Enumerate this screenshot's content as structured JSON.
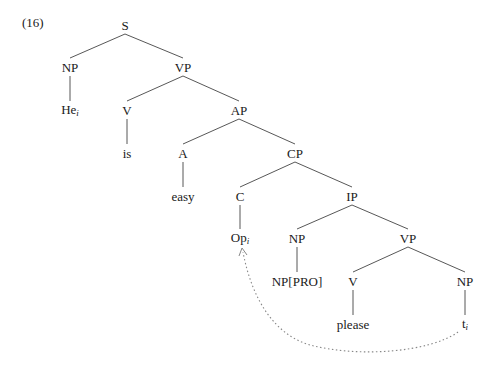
{
  "example_number": "(16)",
  "tree": {
    "nodes": [
      {
        "id": "S",
        "label": "S",
        "x": 125,
        "y": 25
      },
      {
        "id": "NP1",
        "label": "NP",
        "x": 70,
        "y": 67
      },
      {
        "id": "VP1",
        "label": "VP",
        "x": 183,
        "y": 67
      },
      {
        "id": "He",
        "label": "He",
        "sub": "i",
        "x": 70,
        "y": 110
      },
      {
        "id": "V1",
        "label": "V",
        "x": 127,
        "y": 110
      },
      {
        "id": "AP",
        "label": "AP",
        "x": 239,
        "y": 110
      },
      {
        "id": "is",
        "label": "is",
        "x": 127,
        "y": 153
      },
      {
        "id": "A",
        "label": "A",
        "x": 183,
        "y": 153
      },
      {
        "id": "CP",
        "label": "CP",
        "x": 295,
        "y": 153
      },
      {
        "id": "easy",
        "label": "easy",
        "x": 183,
        "y": 196
      },
      {
        "id": "C",
        "label": "C",
        "x": 240,
        "y": 196
      },
      {
        "id": "IP",
        "label": "IP",
        "x": 352,
        "y": 196
      },
      {
        "id": "Op",
        "label": "Op",
        "sub": "i",
        "x": 240,
        "y": 238
      },
      {
        "id": "NP2",
        "label": "NP",
        "x": 297,
        "y": 238
      },
      {
        "id": "VP2",
        "label": "VP",
        "x": 408,
        "y": 238
      },
      {
        "id": "PRO",
        "label": "NP[PRO]",
        "x": 297,
        "y": 281
      },
      {
        "id": "V2",
        "label": "V",
        "x": 353,
        "y": 281
      },
      {
        "id": "NP3",
        "label": "NP",
        "x": 465,
        "y": 281
      },
      {
        "id": "please",
        "label": "please",
        "x": 353,
        "y": 324
      },
      {
        "id": "t",
        "label": "t",
        "sub": "i",
        "x": 465,
        "y": 324
      }
    ],
    "edges": [
      [
        "S",
        "NP1"
      ],
      [
        "S",
        "VP1"
      ],
      [
        "NP1",
        "He"
      ],
      [
        "VP1",
        "V1"
      ],
      [
        "VP1",
        "AP"
      ],
      [
        "V1",
        "is"
      ],
      [
        "AP",
        "A"
      ],
      [
        "AP",
        "CP"
      ],
      [
        "A",
        "easy"
      ],
      [
        "CP",
        "C"
      ],
      [
        "CP",
        "IP"
      ],
      [
        "C",
        "Op"
      ],
      [
        "IP",
        "NP2"
      ],
      [
        "IP",
        "VP2"
      ],
      [
        "NP2",
        "PRO"
      ],
      [
        "VP2",
        "V2"
      ],
      [
        "VP2",
        "NP3"
      ],
      [
        "V2",
        "please"
      ],
      [
        "NP3",
        "t"
      ]
    ],
    "movement_arrow": {
      "from": "t",
      "to": "Op",
      "style": "dotted"
    }
  }
}
